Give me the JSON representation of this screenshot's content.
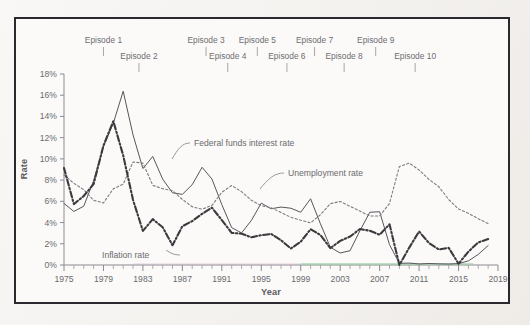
{
  "figure": {
    "y_axis_title": "Rate",
    "x_axis_title": "Year"
  },
  "episodes": [
    {
      "label": "Episode 1",
      "year": 1979.0,
      "row": 0
    },
    {
      "label": "Episode 2",
      "year": 1982.6,
      "row": 1
    },
    {
      "label": "Episode 3",
      "year": 1989.4,
      "row": 0
    },
    {
      "label": "Episode 4",
      "year": 1991.6,
      "row": 1
    },
    {
      "label": "Episode 5",
      "year": 1994.6,
      "row": 0
    },
    {
      "label": "Episode 6",
      "year": 1997.6,
      "row": 1
    },
    {
      "label": "Episode 7",
      "year": 2000.4,
      "row": 0
    },
    {
      "label": "Episode 8",
      "year": 2003.4,
      "row": 1
    },
    {
      "label": "Episode 9",
      "year": 2006.6,
      "row": 0
    },
    {
      "label": "Episode 10",
      "year": 2010.6,
      "row": 1
    }
  ],
  "annotations": [
    {
      "name": "federal-funds-label",
      "text": "Federal funds interest rate"
    },
    {
      "name": "unemployment-label",
      "text": "Unemployment rate"
    },
    {
      "name": "inflation-label",
      "text": "Inflation rate"
    }
  ],
  "chart_data": {
    "type": "line",
    "title": "",
    "xlabel": "Year",
    "ylabel": "Rate",
    "xlim": [
      1975,
      2019
    ],
    "ylim": [
      0,
      18
    ],
    "grid": false,
    "legend": "inline-annotations",
    "ytick_labels": [
      "0%",
      "2%",
      "4%",
      "6%",
      "8%",
      "10%",
      "12%",
      "14%",
      "16%",
      "18%"
    ],
    "ytick_values": [
      0,
      2,
      4,
      6,
      8,
      10,
      12,
      14,
      16,
      18
    ],
    "xtick_labels": [
      "1975",
      "1979",
      "1983",
      "1987",
      "1991",
      "1995",
      "1999",
      "2003",
      "2007",
      "2011",
      "2015",
      "2019"
    ],
    "xtick_values": [
      1975,
      1979,
      1983,
      1987,
      1991,
      1995,
      1999,
      2003,
      2007,
      2011,
      2015,
      2019
    ],
    "x": [
      1975,
      1976,
      1977,
      1978,
      1979,
      1980,
      1981,
      1982,
      1983,
      1984,
      1985,
      1986,
      1987,
      1988,
      1989,
      1990,
      1991,
      1992,
      1993,
      1994,
      1995,
      1996,
      1997,
      1998,
      1999,
      2000,
      2001,
      2002,
      2003,
      2004,
      2005,
      2006,
      2007,
      2008,
      2009,
      2010,
      2011,
      2012,
      2013,
      2014,
      2015,
      2016,
      2017,
      2018
    ],
    "series": [
      {
        "name": "Federal funds interest rate",
        "style": "solid-thin",
        "color": "#56565b",
        "values": [
          5.8,
          5.05,
          5.54,
          7.93,
          11.19,
          13.36,
          16.38,
          12.26,
          9.09,
          10.23,
          8.1,
          6.8,
          6.66,
          7.57,
          9.21,
          8.1,
          5.69,
          3.52,
          3.02,
          4.21,
          5.83,
          5.3,
          5.46,
          5.35,
          4.97,
          6.24,
          3.88,
          1.67,
          1.13,
          1.35,
          3.22,
          4.97,
          5.02,
          1.92,
          0.16,
          0.18,
          0.1,
          0.14,
          0.11,
          0.09,
          0.13,
          0.39,
          1.0,
          1.83
        ]
      },
      {
        "name": "Unemployment rate",
        "style": "dotted",
        "color": "#7d7d82",
        "values": [
          8.5,
          7.7,
          7.1,
          6.1,
          5.85,
          7.18,
          7.62,
          9.71,
          9.6,
          7.51,
          7.19,
          7.0,
          6.18,
          5.49,
          5.26,
          5.62,
          6.85,
          7.49,
          6.91,
          6.1,
          5.59,
          5.41,
          4.94,
          4.5,
          4.22,
          3.97,
          4.74,
          5.78,
          5.99,
          5.53,
          5.08,
          4.62,
          4.62,
          5.8,
          9.28,
          9.61,
          8.95,
          8.07,
          7.38,
          6.17,
          5.28,
          4.87,
          4.36,
          3.9
        ]
      },
      {
        "name": "Inflation rate",
        "style": "dash-dot-bold",
        "color": "#3a3a3f",
        "values": [
          9.14,
          5.74,
          6.5,
          7.62,
          11.25,
          13.55,
          10.33,
          6.13,
          3.21,
          4.32,
          3.56,
          1.86,
          3.65,
          4.14,
          4.82,
          5.4,
          4.23,
          3.03,
          2.95,
          2.61,
          2.81,
          2.93,
          2.34,
          1.55,
          2.19,
          3.38,
          2.83,
          1.59,
          2.27,
          2.68,
          3.39,
          3.23,
          2.85,
          3.84,
          -0.36,
          1.64,
          3.16,
          2.07,
          1.46,
          1.62,
          0.12,
          1.26,
          2.13,
          2.44
        ]
      }
    ]
  }
}
